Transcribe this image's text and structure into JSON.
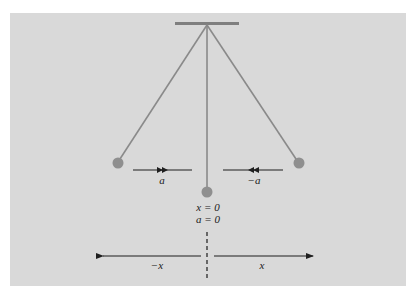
{
  "diagram": {
    "type": "pendulum-acceleration",
    "colors": {
      "background_panel": "#d9d9d9",
      "page": "#ffffff",
      "string": "#8a8a8a",
      "bob": "#8f8f8f",
      "support": "#7f7f7f",
      "arrow": "#1f1f1f"
    },
    "labels": {
      "left_accel": "a",
      "right_accel": "−a",
      "center_position": "x = 0",
      "center_accel": "a = 0",
      "axis_negative": "−x",
      "axis_positive": "x"
    },
    "elements": {
      "support_bar": "ceiling-support",
      "strings": [
        "left-string",
        "center-string",
        "right-string"
      ],
      "bobs": [
        "left-bob",
        "center-bob",
        "right-bob"
      ]
    }
  }
}
